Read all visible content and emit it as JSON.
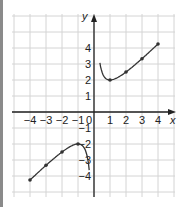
{
  "chart_data": {
    "type": "line",
    "title": "",
    "xlabel": "x",
    "ylabel": "y",
    "xlim": [
      -5,
      5
    ],
    "ylim": [
      -5,
      6
    ],
    "grid": true,
    "x_ticks": [
      "-4",
      "-3",
      "-2",
      "-1",
      "1",
      "2",
      "3",
      "4"
    ],
    "y_ticks": [
      "4",
      "3",
      "2",
      "1",
      "-1",
      "-2",
      "-3",
      "-4"
    ],
    "origin_label": "0",
    "series": [
      {
        "name": "right-branch",
        "points": [
          [
            0.37,
            5.3
          ],
          [
            0.5,
            2.5
          ],
          [
            1,
            2
          ],
          [
            2,
            2.5
          ],
          [
            3,
            3.33
          ],
          [
            4,
            4.25
          ]
        ],
        "markers": [
          [
            1,
            2
          ],
          [
            2,
            2.5
          ],
          [
            3,
            3.33
          ],
          [
            4,
            4.25
          ]
        ]
      },
      {
        "name": "left-branch",
        "points": [
          [
            -4,
            -4.25
          ],
          [
            -3,
            -3.33
          ],
          [
            -2,
            -2.5
          ],
          [
            -1,
            -2
          ],
          [
            -0.5,
            -2.5
          ],
          [
            -0.3,
            -4.6
          ]
        ],
        "markers": [
          [
            -4,
            -4.25
          ],
          [
            -3,
            -3.33
          ],
          [
            -2,
            -2.5
          ],
          [
            -1,
            -2
          ]
        ]
      }
    ],
    "colors": {
      "curve": "#333333",
      "grid": "#d4d4d4",
      "axis": "#222222"
    }
  }
}
